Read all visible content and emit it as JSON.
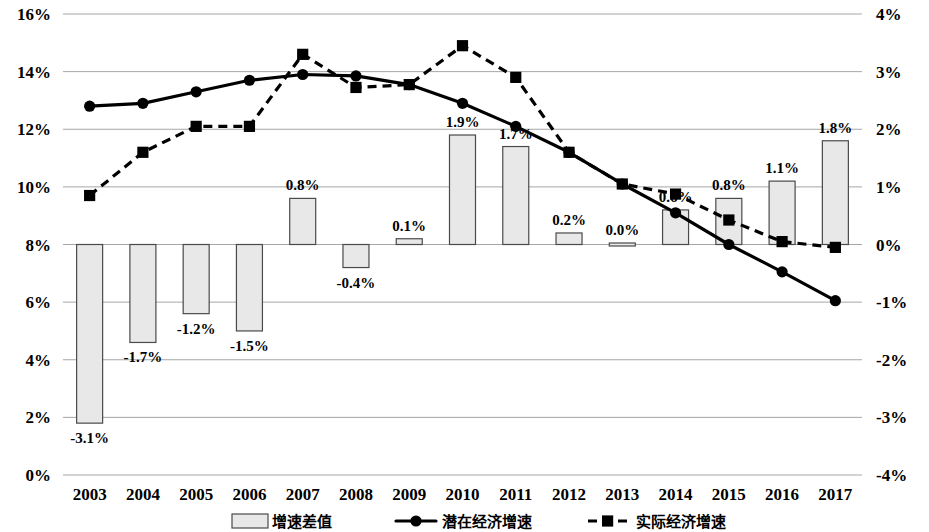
{
  "chart_data": {
    "type": "bar",
    "title": "",
    "subtitle": "",
    "xlabel": "",
    "ylabel": "",
    "y2label": "",
    "grid": true,
    "legend_position": "bottom",
    "categories": [
      "2003",
      "2004",
      "2005",
      "2006",
      "2007",
      "2008",
      "2009",
      "2010",
      "2011",
      "2012",
      "2013",
      "2014",
      "2015",
      "2016",
      "2017"
    ],
    "left_axis": {
      "ticks": [
        "0%",
        "2%",
        "4%",
        "6%",
        "8%",
        "10%",
        "12%",
        "14%",
        "16%"
      ],
      "values": [
        0,
        2,
        4,
        6,
        8,
        10,
        12,
        14,
        16
      ],
      "min": 0,
      "max": 16
    },
    "right_axis": {
      "ticks": [
        "-4%",
        "-3%",
        "-2%",
        "-1%",
        "0%",
        "1%",
        "2%",
        "3%",
        "4%"
      ],
      "values": [
        -4,
        -3,
        -2,
        -1,
        0,
        1,
        2,
        3,
        4
      ],
      "min": -4,
      "max": 4
    },
    "series": [
      {
        "name": "增速差值",
        "kind": "bar",
        "axis": "right",
        "values": [
          -3.1,
          -1.7,
          -1.2,
          -1.5,
          0.8,
          -0.4,
          0.1,
          1.9,
          1.7,
          0.2,
          0.0,
          0.6,
          0.8,
          1.1,
          1.8
        ],
        "labels": [
          "-3.1%",
          "-1.7%",
          "-1.2%",
          "-1.5%",
          "0.8%",
          "-0.4%",
          "0.1%",
          "1.9%",
          "1.7%",
          "0.2%",
          "0.0%",
          "0.6%",
          "0.8%",
          "1.1%",
          "1.8%"
        ]
      },
      {
        "name": "潜在经济增速",
        "kind": "line-solid-circle",
        "axis": "left",
        "values": [
          12.8,
          12.9,
          13.3,
          13.7,
          13.9,
          13.85,
          13.55,
          12.9,
          12.1,
          11.2,
          10.1,
          9.1,
          8.0,
          7.05,
          6.05
        ]
      },
      {
        "name": "实际经济增速",
        "kind": "line-dashed-square",
        "axis": "left",
        "values": [
          9.7,
          11.2,
          12.1,
          12.1,
          14.6,
          13.45,
          13.55,
          14.9,
          13.8,
          11.2,
          10.1,
          9.75,
          8.85,
          8.1,
          7.9
        ]
      }
    ]
  },
  "legend": {
    "items": [
      {
        "label": "增速差值",
        "marker": "bar-swatch"
      },
      {
        "label": "潜在经济增速",
        "marker": "solid-line-circle"
      },
      {
        "label": "实际经济增速",
        "marker": "dashed-line-square"
      }
    ]
  },
  "colors": {
    "bar_fill": "#e8e8e8",
    "bar_stroke": "#4a4a4a",
    "line": "#000000",
    "gridline": "#a6a6a6",
    "background": "#ffffff"
  }
}
